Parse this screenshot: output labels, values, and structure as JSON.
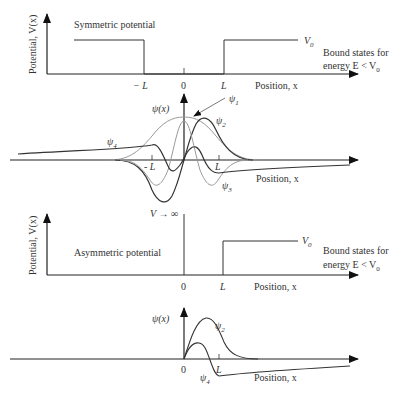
{
  "symmetric": {
    "y_axis_label": "Potential, V(x)",
    "title": "Symmetric potential",
    "v0_label": "V",
    "v0_sub": "0",
    "tick_neg_L": "− L",
    "tick_zero": "0",
    "tick_L": "L",
    "x_axis_label": "Position, x",
    "bound_line1": "Bound states for",
    "bound_line2": "energy E < V",
    "bound_sub": "0"
  },
  "symmetric_wavefunctions": {
    "y_axis_label": "ψ(x)",
    "psi1": "ψ",
    "psi1_sub": "1",
    "psi2": "ψ",
    "psi2_sub": "2",
    "psi3": "ψ",
    "psi3_sub": "3",
    "psi4": "ψ",
    "psi4_sub": "4",
    "tick_neg_L": "- L",
    "tick_L": "L",
    "x_axis_label": "Position, x"
  },
  "asymmetric": {
    "y_axis_label": "Potential, V(x)",
    "title": "Asymmetric potential",
    "infinite_label": "V → ∞",
    "v0_label": "V",
    "v0_sub": "0",
    "tick_zero": "0",
    "tick_L": "L",
    "x_axis_label": "Position, x",
    "bound_line1": "Bound states for",
    "bound_line2": "energy E < V",
    "bound_sub": "0"
  },
  "asymmetric_wavefunctions": {
    "y_axis_label": "ψ(x)",
    "psi2": "ψ",
    "psi2_sub": "2",
    "psi4": "ψ",
    "psi4_sub": "4",
    "tick_zero": "0",
    "tick_L": "L",
    "x_axis_label": "Position, x"
  }
}
